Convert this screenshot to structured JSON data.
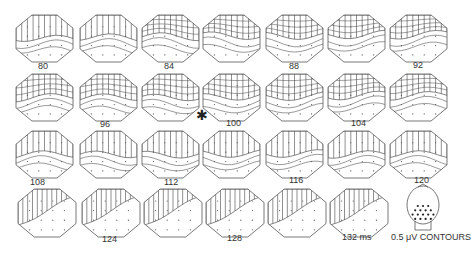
{
  "figure": {
    "type": "topographic-map-sequence",
    "contour_label": "0.5 μV CONTOURS",
    "marker_symbol": "✱",
    "marker_position_after_frame": 100,
    "colors": {
      "line": "#555555",
      "hatch": "#444444",
      "background": "#ffffff",
      "text": "#333333"
    }
  },
  "rows": [
    {
      "y": 15,
      "h": 47,
      "x": [
        16,
        80,
        142,
        203,
        266,
        328,
        390
      ],
      "w": 57
    },
    {
      "y": 74,
      "h": 47,
      "x": [
        16,
        80,
        142,
        203,
        266,
        328,
        390
      ],
      "w": 57
    },
    {
      "y": 131,
      "h": 47,
      "x": [
        16,
        80,
        142,
        203,
        266,
        328,
        390
      ],
      "w": 57
    },
    {
      "y": 189,
      "h": 48,
      "x": [
        18,
        82,
        144,
        206,
        268,
        330
      ],
      "w": 58
    }
  ],
  "maps": [
    {
      "frame": 1,
      "row": 0,
      "col": 0,
      "label": "80",
      "shade": 0.5,
      "split": 0.35
    },
    {
      "frame": 2,
      "row": 0,
      "col": 1,
      "label": "",
      "shade": 0.48,
      "split": 0.4
    },
    {
      "frame": 3,
      "row": 0,
      "col": 2,
      "label": "84",
      "shade": 0.46,
      "split": 0.45
    },
    {
      "frame": 4,
      "row": 0,
      "col": 3,
      "label": "",
      "shade": 0.44,
      "split": 0.5
    },
    {
      "frame": 5,
      "row": 0,
      "col": 4,
      "label": "88",
      "shade": 0.44,
      "split": 0.55
    },
    {
      "frame": 6,
      "row": 0,
      "col": 5,
      "label": "",
      "shade": 0.42,
      "split": 0.6
    },
    {
      "frame": 7,
      "row": 0,
      "col": 6,
      "label": "92",
      "shade": 0.42,
      "split": 0.62
    },
    {
      "frame": 8,
      "row": 1,
      "col": 0,
      "label": "",
      "shade": 0.5,
      "split": 0.6
    },
    {
      "frame": 9,
      "row": 1,
      "col": 1,
      "label": "96",
      "shade": 0.5,
      "split": 0.6
    },
    {
      "frame": 10,
      "row": 1,
      "col": 2,
      "label": "",
      "shade": 0.5,
      "split": 0.62
    },
    {
      "frame": 11,
      "row": 1,
      "col": 3,
      "label": "100",
      "shade": 0.48,
      "split": 0.62
    },
    {
      "frame": 12,
      "row": 1,
      "col": 4,
      "label": "",
      "shade": 0.48,
      "split": 0.62
    },
    {
      "frame": 13,
      "row": 1,
      "col": 5,
      "label": "104",
      "shade": 0.46,
      "split": 0.62
    },
    {
      "frame": 14,
      "row": 1,
      "col": 6,
      "label": "",
      "shade": 0.46,
      "split": 0.62
    },
    {
      "frame": 15,
      "row": 2,
      "col": 0,
      "label": "108",
      "shade": 0.5,
      "split": 0.6
    },
    {
      "frame": 16,
      "row": 2,
      "col": 1,
      "label": "",
      "shade": 0.5,
      "split": 0.6
    },
    {
      "frame": 17,
      "row": 2,
      "col": 2,
      "label": "112",
      "shade": 0.5,
      "split": 0.58
    },
    {
      "frame": 18,
      "row": 2,
      "col": 3,
      "label": "",
      "shade": 0.48,
      "split": 0.55
    },
    {
      "frame": 19,
      "row": 2,
      "col": 4,
      "label": "116",
      "shade": 0.48,
      "split": 0.52
    },
    {
      "frame": 20,
      "row": 2,
      "col": 5,
      "label": "",
      "shade": 0.5,
      "split": 0.5
    },
    {
      "frame": 21,
      "row": 2,
      "col": 6,
      "label": "120",
      "shade": 0.5,
      "split": 0.48
    },
    {
      "frame": 22,
      "row": 3,
      "col": 0,
      "label": "",
      "shade": 0.55,
      "diag": true
    },
    {
      "frame": 23,
      "row": 3,
      "col": 1,
      "label": "124",
      "shade": 0.55,
      "diag": true
    },
    {
      "frame": 24,
      "row": 3,
      "col": 2,
      "label": "",
      "shade": 0.55,
      "diag": true
    },
    {
      "frame": 25,
      "row": 3,
      "col": 3,
      "label": "128",
      "shade": 0.55,
      "diag": true
    },
    {
      "frame": 26,
      "row": 3,
      "col": 4,
      "label": "",
      "shade": 0.5,
      "diag": true
    },
    {
      "frame": 27,
      "row": 3,
      "col": 5,
      "label": "132 ms",
      "shade": 0.45,
      "diag": true
    }
  ],
  "labels": [
    {
      "text": "80",
      "x": 38,
      "y": 62
    },
    {
      "text": "84",
      "x": 164,
      "y": 62
    },
    {
      "text": "88",
      "x": 289,
      "y": 62
    },
    {
      "text": "92",
      "x": 413,
      "y": 61
    },
    {
      "text": "96",
      "x": 100,
      "y": 120
    },
    {
      "text": "100",
      "x": 226,
      "y": 119
    },
    {
      "text": "104",
      "x": 351,
      "y": 119
    },
    {
      "text": "108",
      "x": 30,
      "y": 178
    },
    {
      "text": "112",
      "x": 164,
      "y": 178
    },
    {
      "text": "116",
      "x": 289,
      "y": 176
    },
    {
      "text": "120",
      "x": 414,
      "y": 176
    },
    {
      "text": "124",
      "x": 102,
      "y": 235
    },
    {
      "text": "128",
      "x": 227,
      "y": 234
    },
    {
      "text": "132 ms",
      "x": 342,
      "y": 233
    }
  ],
  "legend": {
    "head": {
      "cx": 423,
      "cy": 205,
      "rx": 16,
      "ry": 19
    },
    "text": "0.5 μV CONTOURS",
    "text_x": 391,
    "text_y": 233
  },
  "marker": {
    "x": 196,
    "y": 108
  }
}
